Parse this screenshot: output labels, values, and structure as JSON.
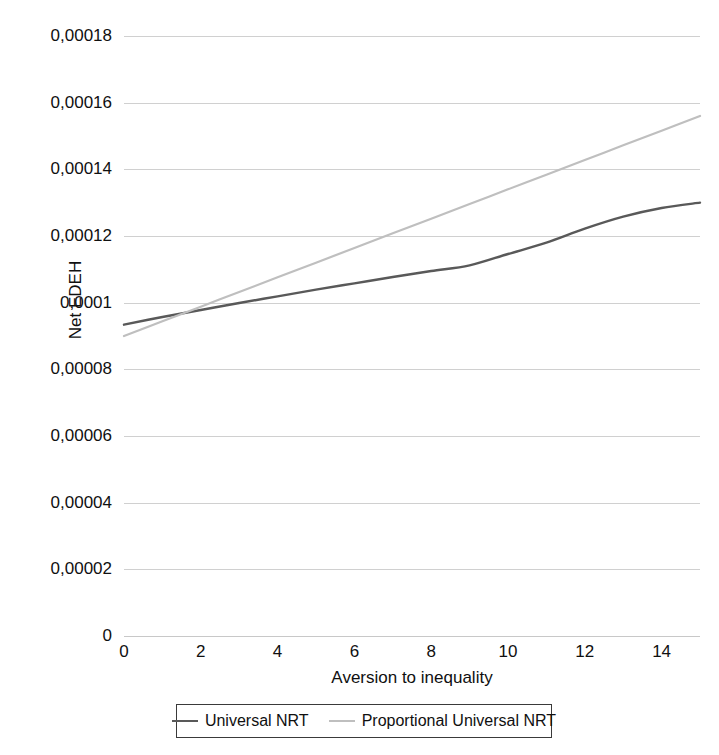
{
  "chart_data": {
    "type": "line",
    "title": "",
    "xlabel": "Aversion to inequality",
    "ylabel": "Net EDEH",
    "xlim": [
      0,
      15
    ],
    "ylim": [
      0,
      0.00018
    ],
    "grid": true,
    "legend_position": "bottom",
    "decimal_separator": ",",
    "x_tick_labels": [
      "0",
      "2",
      "4",
      "6",
      "8",
      "10",
      "12",
      "14"
    ],
    "x_tick_values": [
      0,
      2,
      4,
      6,
      8,
      10,
      12,
      14
    ],
    "y_tick_labels": [
      "0",
      "0,00002",
      "0,00004",
      "0,00006",
      "0,00008",
      "0,0001",
      "0,00012",
      "0,00014",
      "0,00016",
      "0,00018"
    ],
    "y_tick_values": [
      0,
      2e-05,
      4e-05,
      6e-05,
      8e-05,
      0.0001,
      0.00012,
      0.00014,
      0.00016,
      0.00018
    ],
    "x": [
      0,
      1,
      2,
      3,
      4,
      5,
      6,
      7,
      8,
      9,
      10,
      11,
      12,
      13,
      14,
      15
    ],
    "series": [
      {
        "name": "Universal NRT",
        "color": "#595959",
        "width": 2.4,
        "values": [
          9.34e-05,
          9.57e-05,
          9.78e-05,
          9.99e-05,
          0.0001019,
          0.0001039,
          0.0001058,
          0.0001077,
          0.0001095,
          0.0001112,
          0.0001146,
          0.000118,
          0.0001222,
          0.0001258,
          0.0001284,
          0.00013
        ]
      },
      {
        "name": "Proportional Universal NRT",
        "color": "#bfbfbf",
        "width": 2.2,
        "values": [
          9e-05,
          9.44e-05,
          9.88e-05,
          0.0001032,
          0.0001076,
          0.000112,
          0.0001164,
          0.0001208,
          0.0001252,
          0.0001296,
          0.000134,
          0.0001384,
          0.0001428,
          0.0001472,
          0.0001516,
          0.000156
        ]
      }
    ],
    "annotations": []
  },
  "legend": {
    "entries": [
      {
        "label": "Universal NRT"
      },
      {
        "label": "Proportional Universal NRT"
      }
    ]
  }
}
